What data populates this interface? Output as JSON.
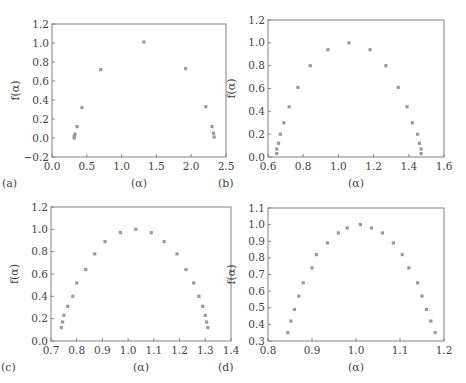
{
  "chart_data": [
    {
      "panel": "(a)",
      "type": "scatter",
      "title": "",
      "xlabel": "(α)",
      "ylabel": "f(α)",
      "xlim": [
        0.0,
        2.5
      ],
      "ylim": [
        -0.2,
        1.2
      ],
      "xticks": [
        "0.0",
        "0.5",
        "1.0",
        "1.5",
        "2.0",
        "2.5"
      ],
      "yticks": [
        "−0.2",
        "0.0",
        "0.2",
        "0.4",
        "0.6",
        "0.8",
        "1.0",
        "1.2"
      ],
      "grid": false,
      "frame": {
        "left": 52,
        "right": 226,
        "top": 24,
        "bottom": 157
      },
      "x": [
        0.32,
        0.32,
        0.33,
        0.36,
        0.43,
        0.7,
        1.32,
        1.92,
        2.21,
        2.3,
        2.32,
        2.33
      ],
      "y": [
        0.0,
        0.02,
        0.04,
        0.12,
        0.32,
        0.72,
        1.01,
        0.73,
        0.33,
        0.12,
        0.05,
        0.01
      ]
    },
    {
      "panel": "(b)",
      "type": "scatter",
      "title": "",
      "xlabel": "(α)",
      "ylabel": "f(α)",
      "xlim": [
        0.6,
        1.6
      ],
      "ylim": [
        0.0,
        1.2
      ],
      "xticks": [
        "0.6",
        "0.8",
        "1.0",
        "1.2",
        "1.4",
        "1.6"
      ],
      "yticks": [
        "0.0",
        "0.2",
        "0.4",
        "0.6",
        "0.8",
        "1.0",
        "1.2"
      ],
      "grid": false,
      "frame": {
        "left": 268,
        "right": 444,
        "top": 20,
        "bottom": 157
      },
      "x": [
        0.65,
        0.65,
        0.66,
        0.67,
        0.69,
        0.72,
        0.77,
        0.84,
        0.94,
        1.06,
        1.18,
        1.27,
        1.34,
        1.39,
        1.42,
        1.45,
        1.46,
        1.47,
        1.47
      ],
      "y": [
        0.03,
        0.07,
        0.12,
        0.2,
        0.3,
        0.44,
        0.61,
        0.8,
        0.94,
        1.0,
        0.94,
        0.8,
        0.61,
        0.44,
        0.3,
        0.2,
        0.12,
        0.07,
        0.03
      ]
    },
    {
      "panel": "(c)",
      "type": "scatter",
      "title": "",
      "xlabel": "(α)",
      "ylabel": "f(α)",
      "xlim": [
        0.7,
        1.4
      ],
      "ylim": [
        0.0,
        1.2
      ],
      "xticks": [
        "0.7",
        "0.8",
        "0.9",
        "1.0",
        "1.1",
        "1.2",
        "1.3",
        "1.4"
      ],
      "yticks": [
        "0.0",
        "0.2",
        "0.4",
        "0.6",
        "0.8",
        "1.0",
        "1.2"
      ],
      "grid": false,
      "frame": {
        "left": 51,
        "right": 231,
        "top": 207,
        "bottom": 341
      },
      "x": [
        0.74,
        0.745,
        0.75,
        0.765,
        0.785,
        0.8,
        0.835,
        0.87,
        0.91,
        0.97,
        1.03,
        1.09,
        1.14,
        1.19,
        1.225,
        1.255,
        1.275,
        1.29,
        1.3,
        1.305,
        1.31
      ],
      "y": [
        0.12,
        0.17,
        0.23,
        0.31,
        0.4,
        0.52,
        0.64,
        0.78,
        0.89,
        0.97,
        1.0,
        0.97,
        0.89,
        0.78,
        0.64,
        0.52,
        0.4,
        0.31,
        0.23,
        0.17,
        0.12
      ]
    },
    {
      "panel": "(d)",
      "type": "scatter",
      "title": "",
      "xlabel": "(α)",
      "ylabel": "f(α)",
      "xlim": [
        0.8,
        1.2
      ],
      "ylim": [
        0.3,
        1.1
      ],
      "xticks": [
        "0.8",
        "0.9",
        "1.0",
        "1.1",
        "1.2"
      ],
      "yticks": [
        "0.3",
        "0.4",
        "0.5",
        "0.6",
        "0.7",
        "0.8",
        "0.9",
        "1.0",
        "1.1"
      ],
      "grid": false,
      "frame": {
        "left": 268,
        "right": 444,
        "top": 208,
        "bottom": 341
      },
      "x": [
        0.845,
        0.852,
        0.86,
        0.87,
        0.88,
        0.9,
        0.91,
        0.935,
        0.96,
        0.98,
        1.01,
        1.035,
        1.06,
        1.085,
        1.105,
        1.12,
        1.14,
        1.15,
        1.16,
        1.17,
        1.18
      ],
      "y": [
        0.35,
        0.42,
        0.49,
        0.57,
        0.65,
        0.74,
        0.82,
        0.89,
        0.95,
        0.98,
        1.0,
        0.98,
        0.95,
        0.89,
        0.82,
        0.74,
        0.65,
        0.57,
        0.49,
        0.42,
        0.35
      ]
    }
  ],
  "panels": {
    "a": {
      "label": "(a)",
      "xlabel": "(α)",
      "ylabel": "f(α)"
    },
    "b": {
      "label": "(b)",
      "xlabel": "(α)",
      "ylabel": "f(α)"
    },
    "c": {
      "label": "(c)",
      "xlabel": "(α)",
      "ylabel": "f(α)"
    },
    "d": {
      "label": "(d)",
      "xlabel": "(α)",
      "ylabel": "f(α)"
    }
  },
  "colors": {
    "marker": "#9a9a9a",
    "axis": "#777777",
    "text": "#444444"
  }
}
